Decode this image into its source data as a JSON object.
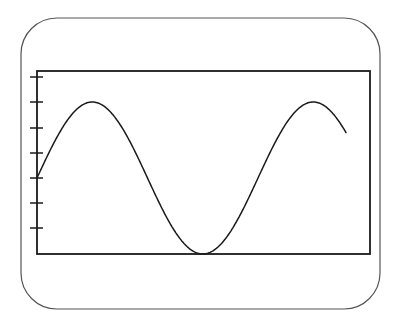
{
  "figure": {
    "colors": {
      "background": "#ffffff",
      "frame_stroke": "#555555",
      "axes_stroke": "#1a1a1a",
      "curve_stroke": "#1a1a1a"
    },
    "outer_frame": {
      "x": 21,
      "y": 18,
      "width": 359,
      "height": 291,
      "corner_radius": 36
    },
    "axes_box": {
      "x": 37,
      "y": 71,
      "width": 333,
      "height": 183
    },
    "y_ticks": [
      77,
      102,
      128,
      153,
      178,
      203,
      228
    ],
    "tick_length_left": 7,
    "tick_length_right": 6,
    "curve": {
      "function": "sine",
      "x_start": 37,
      "x_end": 346,
      "center_y": 178,
      "amplitude_px": 76,
      "period_px": 221,
      "phase_start": 0
    }
  }
}
